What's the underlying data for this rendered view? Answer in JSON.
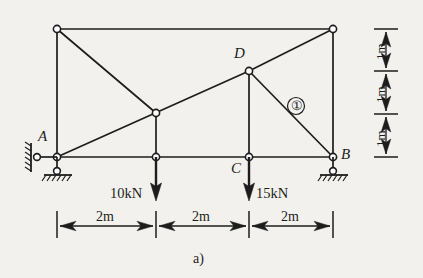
{
  "figure": {
    "caption": "a)",
    "type": "plane-truss-diagram"
  },
  "nodes": [
    {
      "id": "TL",
      "label": "",
      "x": 57,
      "y": 29,
      "support": "none"
    },
    {
      "id": "TR",
      "label": "",
      "x": 333,
      "y": 29,
      "support": "none"
    },
    {
      "id": "E",
      "label": "",
      "x": 156,
      "y": 113,
      "support": "none"
    },
    {
      "id": "D",
      "label": "D",
      "x": 249,
      "y": 71,
      "support": "none"
    },
    {
      "id": "A",
      "label": "A",
      "x": 57,
      "y": 157,
      "support": "pin"
    },
    {
      "id": "F",
      "label": "",
      "x": 156,
      "y": 157,
      "support": "none"
    },
    {
      "id": "C",
      "label": "C",
      "x": 249,
      "y": 157,
      "support": "none"
    },
    {
      "id": "B",
      "label": "B",
      "x": 333,
      "y": 157,
      "support": "pin"
    }
  ],
  "members": [
    {
      "from": "TL",
      "to": "TR",
      "name": "top-chord"
    },
    {
      "from": "TL",
      "to": "A",
      "name": "left-vertical"
    },
    {
      "from": "TR",
      "to": "B",
      "name": "right-vertical"
    },
    {
      "from": "A",
      "to": "F",
      "name": "bottom-chord-1"
    },
    {
      "from": "F",
      "to": "C",
      "name": "bottom-chord-2"
    },
    {
      "from": "C",
      "to": "B",
      "name": "bottom-chord-3"
    },
    {
      "from": "TL",
      "to": "E",
      "name": "diagonal-tl-e"
    },
    {
      "from": "A",
      "to": "E",
      "name": "diagonal-a-e"
    },
    {
      "from": "E",
      "to": "D",
      "name": "diagonal-e-d"
    },
    {
      "from": "D",
      "to": "TR",
      "name": "diagonal-d-tr"
    },
    {
      "from": "E",
      "to": "F",
      "name": "vertical-e-f"
    },
    {
      "from": "D",
      "to": "C",
      "name": "vertical-d-c"
    },
    {
      "from": "D",
      "to": "B",
      "name": "diagonal-d-b"
    }
  ],
  "member_labels": [
    {
      "text": "①",
      "at_x": 296,
      "at_y": 106,
      "refers_to": "diagonal-d-b"
    }
  ],
  "node_labels": {
    "A": "A",
    "B": "B",
    "C": "C",
    "D": "D"
  },
  "loads": [
    {
      "label": "10kN",
      "magnitude": 10,
      "unit": "kN",
      "at_node": "F",
      "direction": "down",
      "text_side": "left"
    },
    {
      "label": "15kN",
      "magnitude": 15,
      "unit": "kN",
      "at_node": "C",
      "direction": "down",
      "text_side": "right"
    }
  ],
  "horizontal_dimensions": [
    {
      "label": "2m",
      "value": 2,
      "unit": "m",
      "from_x": 57,
      "to_x": 156
    },
    {
      "label": "2m",
      "value": 2,
      "unit": "m",
      "from_x": 156,
      "to_x": 249
    },
    {
      "label": "2m",
      "value": 2,
      "unit": "m",
      "from_x": 249,
      "to_x": 333
    }
  ],
  "vertical_dimensions": [
    {
      "label": "1m",
      "value": 1,
      "unit": "m",
      "from_y": 29,
      "to_y": 71
    },
    {
      "label": "1m",
      "value": 1,
      "unit": "m",
      "from_y": 71,
      "to_y": 114
    },
    {
      "label": "1m",
      "value": 1,
      "unit": "m",
      "from_y": 114,
      "to_y": 157
    }
  ],
  "supports": [
    {
      "at_node": "A",
      "type": "pin-wall-and-ground",
      "name": "support-a"
    },
    {
      "at_node": "B",
      "type": "pin-ground",
      "name": "support-b"
    }
  ],
  "colors": {
    "background": "#f2f1ee",
    "line": "#1d1d1d",
    "node_fill": "#ffffff"
  }
}
